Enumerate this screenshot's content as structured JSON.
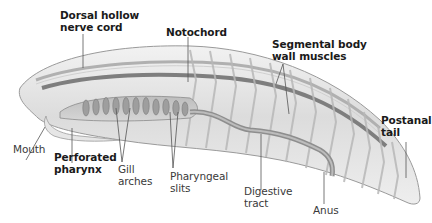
{
  "diagram": {
    "colors": {
      "body_fill": "#e8e8e8",
      "body_outline": "#9a9a9a",
      "structure_dark": "#8a8a8a",
      "leader_line": "#555555",
      "label_bold": "#1a1a1a",
      "label_regular": "#3a3a3a"
    },
    "labels": {
      "dorsal_nerve_cord": {
        "line1": "Dorsal hollow",
        "line2": "nerve cord",
        "bold": true
      },
      "notochord": {
        "line1": "Notochord",
        "bold": true
      },
      "segmental_muscles": {
        "line1": "Segmental body",
        "line2": "wall muscles",
        "bold": true
      },
      "postanal_tail": {
        "line1": "Postanal",
        "line2": "tail",
        "bold": true
      },
      "mouth": {
        "line1": "Mouth",
        "bold": false
      },
      "perforated_pharynx": {
        "line1": "Perforated",
        "line2": "pharynx",
        "bold": true
      },
      "gill_arches": {
        "line1": "Gill",
        "line2": "arches",
        "bold": false
      },
      "pharyngeal_slits": {
        "line1": "Pharyngeal",
        "line2": "slits",
        "bold": false
      },
      "digestive_tract": {
        "line1": "Digestive",
        "line2": "tract",
        "bold": false
      },
      "anus": {
        "line1": "Anus",
        "bold": false
      }
    }
  }
}
